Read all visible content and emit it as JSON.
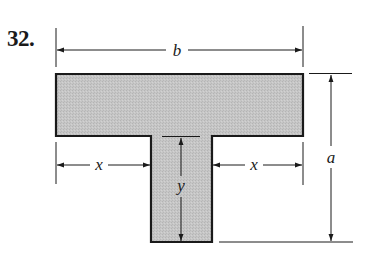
{
  "problem": {
    "number": "32."
  },
  "figure": {
    "type": "T-shaped cross-section",
    "fill_color": "#c4c4c4",
    "stroke_color": "#1a1a1a",
    "dimensions": {
      "b": "b",
      "a": "a",
      "x_left": "x",
      "x_right": "x",
      "y": "y"
    }
  }
}
